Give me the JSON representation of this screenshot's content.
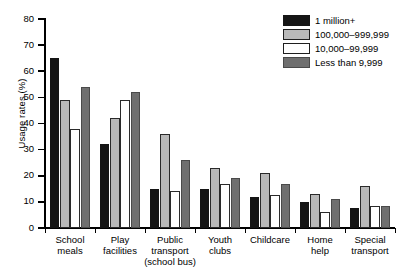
{
  "chart_data": {
    "type": "bar",
    "title": "",
    "xlabel": "",
    "ylabel": "Usage rates (%)",
    "ylim": [
      0,
      80
    ],
    "yticks": [
      0,
      10,
      20,
      30,
      40,
      50,
      60,
      70,
      80
    ],
    "grid": false,
    "legend_position": "top-right",
    "categories": [
      "School meals",
      "Play facilities",
      "Public transport (school bus)",
      "Youth clubs",
      "Childcare",
      "Home help",
      "Special transport"
    ],
    "category_lines": [
      [
        "School",
        "meals"
      ],
      [
        "Play",
        "facilities"
      ],
      [
        "Public",
        "transport",
        "(school bus)"
      ],
      [
        "Youth",
        "clubs"
      ],
      [
        "Childcare"
      ],
      [
        "Home",
        "help"
      ],
      [
        "Special",
        "transport"
      ]
    ],
    "series": [
      {
        "name": "1 million+",
        "color": "#151515",
        "values": [
          65,
          32,
          15,
          15,
          12,
          10,
          7.5
        ]
      },
      {
        "name": "100,000–999,999",
        "color": "#b9b9b9",
        "values": [
          49,
          42,
          36,
          23,
          21,
          13,
          16
        ]
      },
      {
        "name": "10,000–99,999",
        "color": "#ffffff",
        "values": [
          38,
          49,
          14,
          17,
          12.5,
          6,
          8.5
        ]
      },
      {
        "name": "Less than 9,999",
        "color": "#6f6f6f",
        "values": [
          54,
          52,
          26,
          19,
          17,
          11,
          8.5
        ]
      }
    ]
  },
  "legend": {
    "items": [
      {
        "label": "1 million+"
      },
      {
        "label": "100,000–999,999"
      },
      {
        "label": "10,000–99,999"
      },
      {
        "label": "Less than 9,999"
      }
    ]
  },
  "axes": {
    "y_title": "Usage rates (%)"
  }
}
